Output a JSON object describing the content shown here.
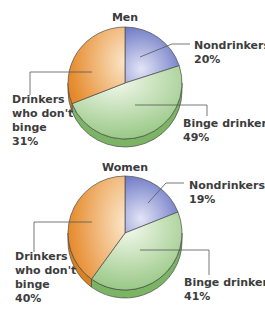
{
  "chart_data": [
    {
      "type": "pie",
      "title": "Men",
      "categories": [
        "Nondrinkers",
        "Binge drinkers",
        "Drinkers who don't binge"
      ],
      "values": [
        20,
        49,
        31
      ],
      "labels": [
        {
          "lines": [
            "Nondrinkers",
            "20%"
          ]
        },
        {
          "lines": [
            "Binge drinkers",
            "49%"
          ]
        },
        {
          "lines": [
            "Drinkers",
            "who don't",
            "binge",
            "31%"
          ]
        }
      ],
      "start_angle": "12 o'clock",
      "direction": "clockwise",
      "style": "3d-tilted"
    },
    {
      "type": "pie",
      "title": "Women",
      "categories": [
        "Nondrinkers",
        "Binge drinkers",
        "Drinkers who don't binge"
      ],
      "values": [
        19,
        41,
        40
      ],
      "labels": [
        {
          "lines": [
            "Nondrinkers",
            "19%"
          ]
        },
        {
          "lines": [
            "Binge drinkers",
            "41%"
          ]
        },
        {
          "lines": [
            "Drinkers",
            "who don't",
            "binge",
            "40%"
          ]
        }
      ],
      "start_angle": "12 o'clock",
      "direction": "clockwise",
      "style": "3d-tilted"
    }
  ],
  "colors": {
    "Nondrinkers": {
      "light": "#d4d8f0",
      "dark": "#6a74c4"
    },
    "Binge drinkers": {
      "light": "#eef6e6",
      "dark": "#8cc07a",
      "side": "#7bb564"
    },
    "Drinkers who don't binge": {
      "light": "#f8dcb6",
      "dark": "#e8902e",
      "side": "#d9821f"
    }
  }
}
